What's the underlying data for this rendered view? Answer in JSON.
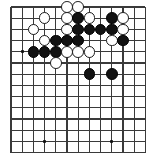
{
  "board": {
    "kind": "go-board",
    "label": "Go board position diagram",
    "columns": 13,
    "rows": 14,
    "origin_x": 11,
    "origin_y": 7,
    "spacing": 11.2,
    "line_color": "#3a3a3a",
    "line_width": 1.1,
    "edge_line_width": 1.6,
    "background_color": "#ffffff",
    "black_color": "#121212",
    "white_color": "#ffffff",
    "stone_radius": 5.9,
    "hoshi_size": 3,
    "hoshi": [
      {
        "col": 1,
        "row": 4
      },
      {
        "col": 3,
        "row": 12
      },
      {
        "col": 9,
        "row": 12
      }
    ],
    "stones": [
      {
        "color": "white",
        "col": 5,
        "row": 0
      },
      {
        "color": "white",
        "col": 6,
        "row": 0
      },
      {
        "color": "white",
        "col": 3,
        "row": 1
      },
      {
        "color": "white",
        "col": 5,
        "row": 1
      },
      {
        "color": "black",
        "col": 6,
        "row": 1
      },
      {
        "color": "white",
        "col": 7,
        "row": 1
      },
      {
        "color": "black",
        "col": 9,
        "row": 1
      },
      {
        "color": "white",
        "col": 10,
        "row": 1
      },
      {
        "color": "white",
        "col": 2,
        "row": 2
      },
      {
        "color": "white",
        "col": 5,
        "row": 2
      },
      {
        "color": "black",
        "col": 6,
        "row": 2
      },
      {
        "color": "black",
        "col": 7,
        "row": 2
      },
      {
        "color": "black",
        "col": 8,
        "row": 2
      },
      {
        "color": "black",
        "col": 9,
        "row": 2
      },
      {
        "color": "white",
        "col": 10,
        "row": 2
      },
      {
        "color": "white",
        "col": 3,
        "row": 3
      },
      {
        "color": "black",
        "col": 4,
        "row": 3
      },
      {
        "color": "black",
        "col": 5,
        "row": 3
      },
      {
        "color": "black",
        "col": 6,
        "row": 3
      },
      {
        "color": "white",
        "col": 9,
        "row": 3
      },
      {
        "color": "black",
        "col": 10,
        "row": 3
      },
      {
        "color": "black",
        "col": 2,
        "row": 4
      },
      {
        "color": "black",
        "col": 3,
        "row": 4
      },
      {
        "color": "black",
        "col": 4,
        "row": 4
      },
      {
        "color": "white",
        "col": 5,
        "row": 4
      },
      {
        "color": "white",
        "col": 6,
        "row": 4
      },
      {
        "color": "white",
        "col": 7,
        "row": 4
      },
      {
        "color": "white",
        "col": 4,
        "row": 5
      },
      {
        "color": "black",
        "col": 7,
        "row": 6
      },
      {
        "color": "black",
        "col": 9,
        "row": 6
      }
    ]
  }
}
